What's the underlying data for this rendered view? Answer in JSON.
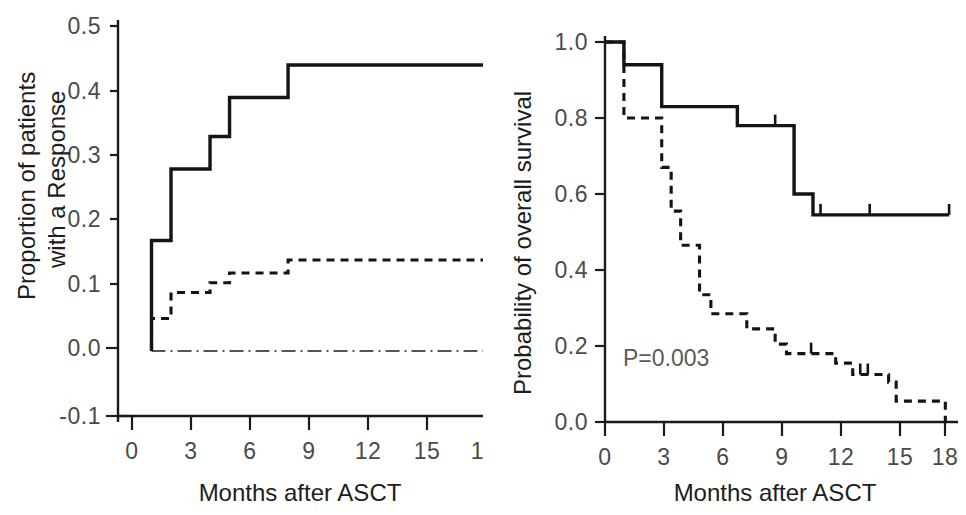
{
  "figure": {
    "panels": [
      "left",
      "right"
    ],
    "background_color": "#ffffff",
    "line_color": "#141414",
    "label_color": "#4a4a4a"
  },
  "left_panel": {
    "y_axis_title_line1": "Proportion of patients",
    "y_axis_title_line2": "with a Response",
    "x_axis_title": "Months after ASCT",
    "y_ticks": [
      "0.5",
      "0.4",
      "0.3",
      "0.2",
      "0.1",
      "0.0",
      "-0.1"
    ],
    "x_ticks": [
      "0",
      "3",
      "6",
      "9",
      "12",
      "15",
      "18"
    ]
  },
  "right_panel": {
    "y_axis_title": "Probability of overall survival",
    "x_axis_title": "Months after ASCT",
    "y_ticks": [
      "1.0",
      "0.8",
      "0.6",
      "0.4",
      "0.2",
      "0.0"
    ],
    "x_ticks": [
      "0",
      "3",
      "6",
      "9",
      "12",
      "15",
      "18"
    ],
    "p_value_label": "P=0.003"
  },
  "bottom_cut_text": "",
  "chart_data": [
    {
      "id": "left",
      "type": "line",
      "subtype": "cumulative-incidence-step",
      "title": "",
      "xlabel": "Months after ASCT",
      "ylabel": "Proportion of patients with a Response",
      "xlim": [
        0,
        18.3
      ],
      "ylim": [
        -0.1,
        0.5
      ],
      "xticks": [
        0,
        3,
        6,
        9,
        12,
        15,
        18
      ],
      "yticks": [
        -0.1,
        0.0,
        0.1,
        0.2,
        0.3,
        0.4,
        0.5
      ],
      "grid": false,
      "legend": "none",
      "series": [
        {
          "name": "Response (solid)",
          "style": "solid",
          "x": [
            1.0,
            1.0,
            2.0,
            2.0,
            4.0,
            4.0,
            5.0,
            5.0,
            8.0,
            8.0,
            18.3
          ],
          "y": [
            0.0,
            0.17,
            0.17,
            0.28,
            0.28,
            0.33,
            0.33,
            0.39,
            0.39,
            0.44,
            0.44
          ],
          "steps": [
            {
              "month": 1,
              "value": 0.17
            },
            {
              "month": 2,
              "value": 0.28
            },
            {
              "month": 4,
              "value": 0.33
            },
            {
              "month": 5,
              "value": 0.39
            },
            {
              "month": 8,
              "value": 0.44
            }
          ]
        },
        {
          "name": "Response (dashed)",
          "style": "dashed",
          "x": [
            1.0,
            1.0,
            2.0,
            2.0,
            4.0,
            4.0,
            5.0,
            5.0,
            8.0,
            8.0,
            18.3
          ],
          "y": [
            0.0,
            0.05,
            0.05,
            0.09,
            0.09,
            0.105,
            0.105,
            0.12,
            0.12,
            0.14,
            0.14
          ],
          "steps": [
            {
              "month": 1,
              "value": 0.05
            },
            {
              "month": 2,
              "value": 0.09
            },
            {
              "month": 4,
              "value": 0.105
            },
            {
              "month": 5,
              "value": 0.12
            },
            {
              "month": 8,
              "value": 0.14
            }
          ]
        },
        {
          "name": "Reference (dash-dot)",
          "style": "dashdot",
          "x": [
            1.0,
            18.3
          ],
          "y": [
            0.0,
            0.0
          ],
          "steps": [
            {
              "month": 1,
              "value": 0.0
            }
          ]
        }
      ]
    },
    {
      "id": "right",
      "type": "line",
      "subtype": "kaplan-meier",
      "title": "",
      "xlabel": "Months after ASCT",
      "ylabel": "Probability of overall survival",
      "xlim": [
        0,
        18.3
      ],
      "ylim": [
        0.0,
        1.0
      ],
      "xticks": [
        0,
        3,
        6,
        9,
        12,
        15,
        18
      ],
      "yticks": [
        0.0,
        0.2,
        0.4,
        0.6,
        0.8,
        1.0
      ],
      "grid": false,
      "legend": "none",
      "annotations": [
        {
          "text": "P=0.003",
          "x": 1.2,
          "y": 0.155
        }
      ],
      "series": [
        {
          "name": "Survival (solid)",
          "style": "solid",
          "x": [
            0.0,
            1.0,
            1.0,
            3.0,
            3.0,
            7.0,
            7.0,
            10.0,
            10.0,
            11.0,
            11.0,
            18.2
          ],
          "y": [
            1.0,
            1.0,
            0.94,
            0.94,
            0.83,
            0.83,
            0.78,
            0.78,
            0.6,
            0.6,
            0.545,
            0.545
          ],
          "steps": [
            {
              "month": 1,
              "value": 0.94
            },
            {
              "month": 3,
              "value": 0.83
            },
            {
              "month": 7,
              "value": 0.78
            },
            {
              "month": 10,
              "value": 0.6
            },
            {
              "month": 11,
              "value": 0.545
            }
          ],
          "censored": [
            {
              "month": 9.0,
              "value": 0.78
            },
            {
              "month": 11.4,
              "value": 0.545
            },
            {
              "month": 14.0,
              "value": 0.545
            },
            {
              "month": 18.2,
              "value": 0.545
            }
          ]
        },
        {
          "name": "Survival (dashed)",
          "style": "dashed",
          "x": [
            0.0,
            1.0,
            1.0,
            2.0,
            2.0,
            3.0,
            3.0,
            3.5,
            3.5,
            4.0,
            4.0,
            5.0,
            5.0,
            5.6,
            5.6,
            6.0,
            6.0,
            7.5,
            7.5,
            8.0,
            8.0,
            9.0,
            9.0,
            9.6,
            9.6,
            10.6,
            10.6,
            12.2,
            12.2,
            13.1,
            13.1,
            14.0,
            14.0,
            15.0,
            15.0,
            15.4,
            15.4,
            16.0,
            16.0,
            18.0,
            18.0
          ],
          "y": [
            1.0,
            1.0,
            0.8,
            0.8,
            0.8,
            0.8,
            0.67,
            0.67,
            0.555,
            0.555,
            0.465,
            0.465,
            0.335,
            0.335,
            0.285,
            0.285,
            0.285,
            0.285,
            0.245,
            0.245,
            0.245,
            0.245,
            0.205,
            0.205,
            0.18,
            0.18,
            0.18,
            0.18,
            0.155,
            0.155,
            0.125,
            0.125,
            0.125,
            0.125,
            0.105,
            0.105,
            0.055,
            0.055,
            0.055,
            0.055,
            0.0
          ],
          "steps": [
            {
              "month": 1,
              "value": 0.8
            },
            {
              "month": 3,
              "value": 0.67
            },
            {
              "month": 3.5,
              "value": 0.555
            },
            {
              "month": 4.0,
              "value": 0.465
            },
            {
              "month": 5.0,
              "value": 0.335
            },
            {
              "month": 5.6,
              "value": 0.285
            },
            {
              "month": 7.5,
              "value": 0.245
            },
            {
              "month": 9.0,
              "value": 0.205
            },
            {
              "month": 9.6,
              "value": 0.18
            },
            {
              "month": 12.2,
              "value": 0.155
            },
            {
              "month": 13.1,
              "value": 0.125
            },
            {
              "month": 15.0,
              "value": 0.105
            },
            {
              "month": 15.4,
              "value": 0.055
            },
            {
              "month": 18.0,
              "value": 0.0
            }
          ],
          "censored": [
            {
              "month": 10.9,
              "value": 0.18
            },
            {
              "month": 13.5,
              "value": 0.125
            },
            {
              "month": 13.9,
              "value": 0.125
            }
          ]
        }
      ]
    }
  ]
}
